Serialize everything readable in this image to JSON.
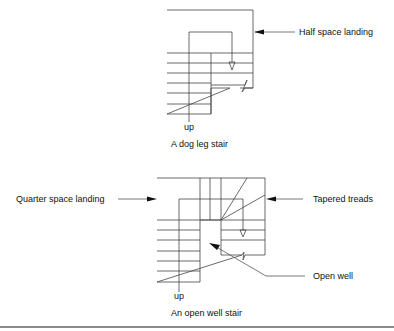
{
  "top_diagram": {
    "callout": "Half space landing",
    "direction_label": "up",
    "caption": "A dog leg stair"
  },
  "bottom_diagram": {
    "callout_left": "Quarter space landing",
    "callout_right": "Tapered treads",
    "callout_well": "Open well",
    "direction_label": "up",
    "caption": "An open well stair"
  },
  "colors": {
    "line": "#333333",
    "text": "#111111",
    "rule": "#8a8a8a"
  }
}
